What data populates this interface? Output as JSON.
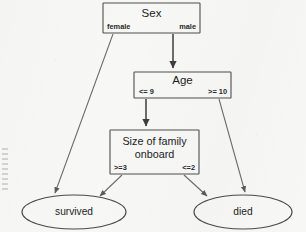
{
  "diagram": {
    "type": "decision-tree",
    "background_color": "#f7f7f6",
    "line_color": "#5a5a5a",
    "text_color": "#1d1d1d",
    "nodes": [
      {
        "id": "sex",
        "shape": "rect",
        "label": "Sex",
        "x": 103,
        "y": 3,
        "w": 97,
        "h": 30,
        "branch_left": "female",
        "branch_right": "male"
      },
      {
        "id": "age",
        "shape": "rect",
        "label": "Age",
        "x": 134,
        "y": 72,
        "w": 97,
        "h": 26,
        "branch_left": "<= 9",
        "branch_right": ">= 10"
      },
      {
        "id": "family",
        "shape": "rect",
        "label_line1": "Size of family",
        "label_line2": "onboard",
        "x": 110,
        "y": 130,
        "w": 89,
        "h": 44,
        "branch_left": ">=3",
        "branch_right": "<=2"
      },
      {
        "id": "survived",
        "shape": "ellipse",
        "label": "survived",
        "cx": 74,
        "cy": 212,
        "rx": 52,
        "ry": 17
      },
      {
        "id": "died",
        "shape": "ellipse",
        "label": "died",
        "cx": 243,
        "cy": 212,
        "rx": 49,
        "ry": 17
      }
    ],
    "edges": [
      {
        "id": "sex-female-survived",
        "from": "sex",
        "to": "survived",
        "label": "female",
        "x1": 113,
        "y1": 34,
        "x2": 55,
        "y2": 196,
        "arrow": true,
        "weight": "thin"
      },
      {
        "id": "sex-male-age",
        "from": "sex",
        "to": "age",
        "label": "male",
        "x1": 173,
        "y1": 34,
        "x2": 173,
        "y2": 71,
        "arrow": true,
        "weight": "thick"
      },
      {
        "id": "age-young-family",
        "from": "age",
        "to": "family",
        "label": "<= 9",
        "x1": 146,
        "y1": 99,
        "x2": 146,
        "y2": 129,
        "arrow": true,
        "weight": "thick"
      },
      {
        "id": "age-old-died",
        "from": "age",
        "to": "died",
        "label": ">= 10",
        "x1": 219,
        "y1": 99,
        "x2": 245,
        "y2": 195,
        "arrow": true,
        "weight": "thin"
      },
      {
        "id": "family-big-survived",
        "from": "family",
        "to": "survived",
        "label": ">=3",
        "x1": 122,
        "y1": 175,
        "x2": 99,
        "y2": 198,
        "arrow": true,
        "weight": "thin"
      },
      {
        "id": "family-small-died",
        "from": "family",
        "to": "died",
        "label": "<=2",
        "x1": 184,
        "y1": 175,
        "x2": 209,
        "y2": 198,
        "arrow": true,
        "weight": "thin"
      }
    ]
  },
  "margin_artifact": {
    "description": "faint illegible vertical scan marks in left margin",
    "visible": true
  }
}
